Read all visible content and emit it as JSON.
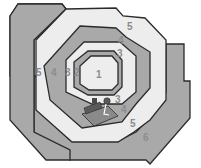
{
  "diagram": {
    "type": "concentric-zones",
    "colors": {
      "dark_zone": "#a9a9a9",
      "light_zone": "#ededed",
      "outline": "#2b2b2b",
      "label": "#8c8c8c"
    },
    "zones": [
      {
        "id": 1,
        "label": "1"
      },
      {
        "id": 2,
        "label": "2"
      },
      {
        "id": 3,
        "label": "3"
      },
      {
        "id": 4,
        "label": "4"
      },
      {
        "id": 5,
        "label": "5"
      },
      {
        "id": 6,
        "label": "6"
      }
    ],
    "labels": [
      {
        "text": "1",
        "x": 100,
        "y": 78
      },
      {
        "text": "2",
        "x": 77,
        "y": 76
      },
      {
        "text": "3",
        "x": 68,
        "y": 76
      },
      {
        "text": "3",
        "x": 120,
        "y": 55
      },
      {
        "text": "3",
        "x": 118,
        "y": 101
      },
      {
        "text": "4",
        "x": 54,
        "y": 76
      },
      {
        "text": "4",
        "x": 121,
        "y": 42
      },
      {
        "text": "4",
        "x": 124,
        "y": 111
      },
      {
        "text": "5",
        "x": 38,
        "y": 76
      },
      {
        "text": "5",
        "x": 130,
        "y": 28
      },
      {
        "text": "5",
        "x": 133,
        "y": 125
      },
      {
        "text": "6",
        "x": 146,
        "y": 139
      }
    ],
    "equipment_icon": "bed-and-person-icon"
  }
}
